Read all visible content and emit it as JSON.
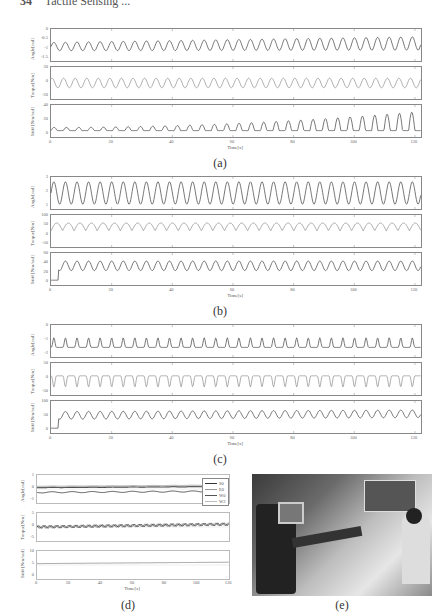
{
  "page": {
    "number": "34",
    "running_header": "Tactile Sensing ..."
  },
  "figure": {
    "captions": [
      "(a)",
      "(b)",
      "(c)",
      "(d)",
      "(e)"
    ],
    "xlabel": "Time[s]",
    "xticks": [
      "0",
      "20",
      "40",
      "60",
      "80",
      "100",
      "120"
    ]
  },
  "chart_data": [
    {
      "type": "line",
      "title": "(a)",
      "xlabel": "Time[s]",
      "xlim": [
        0,
        122
      ],
      "subplots": [
        {
          "ylabel": "Angle[rad]",
          "yticks": [
            "0",
            "-0.5",
            "-1",
            "-1.5"
          ],
          "ylim": [
            -1.5,
            0
          ],
          "description": "sinusoid ~32 cycles, mean ~-0.75, amplitude ~0.15 slowly increasing"
        },
        {
          "ylabel": "Torque[Nm]",
          "yticks": [
            "20",
            "0",
            "-20"
          ],
          "ylim": [
            -20,
            20
          ],
          "description": "oscillation around 0, amplitude ~5"
        },
        {
          "ylabel": "Stiff [Nm/rad]",
          "yticks": [
            "40",
            "20",
            "0"
          ],
          "ylim": [
            0,
            40
          ],
          "description": "oscillation baseline ~8, peaks growing to ~35 after t=90"
        }
      ]
    },
    {
      "type": "line",
      "title": "(b)",
      "xlabel": "Time[s]",
      "xlim": [
        0,
        122
      ],
      "subplots": [
        {
          "ylabel": "Angle[rad]",
          "yticks": [
            "3",
            "2",
            "1"
          ],
          "ylim": [
            1,
            3
          ],
          "description": "large sinusoid ~32 cycles between ~1.3 and ~2.7"
        },
        {
          "ylabel": "Torque[Nm]",
          "yticks": [
            "100",
            "50",
            "0",
            "-50"
          ],
          "ylim": [
            -50,
            100
          ],
          "description": "oscillation between ~0 and ~60"
        },
        {
          "ylabel": "Stiff [Nm/rad]",
          "yticks": [
            "60",
            "40",
            "20",
            "0"
          ],
          "ylim": [
            0,
            60
          ],
          "description": "rises from ~10 to oscillation between ~30 and ~55"
        }
      ]
    },
    {
      "type": "line",
      "title": "(c)",
      "xlabel": "Time[s]",
      "xlim": [
        0,
        122
      ],
      "subplots": [
        {
          "ylabel": "Angle[rad]",
          "yticks": [
            "0",
            "-1",
            "-2"
          ],
          "ylim": [
            -2,
            0
          ],
          "description": "peaky oscillation ~-1.5 to ~-0.8"
        },
        {
          "ylabel": "Torque[Nm]",
          "yticks": [
            "50",
            "0",
            "-50"
          ],
          "ylim": [
            -50,
            50
          ],
          "description": "negative dips to ~-30 from ~0"
        },
        {
          "ylabel": "Stiff [Nm/rad]",
          "yticks": [
            "100",
            "50",
            "0"
          ],
          "ylim": [
            0,
            100
          ],
          "description": "rises from ~10 to oscillation between ~50 and ~85"
        }
      ]
    },
    {
      "type": "line",
      "title": "(d)",
      "xlabel": "Time[s]",
      "xlim": [
        0,
        122
      ],
      "legend": [
        "S0",
        "E0",
        "W0",
        "W2"
      ],
      "legend_position": "upper right",
      "subplots": [
        {
          "ylabel": "Angle[rad]",
          "yticks": [
            "1",
            "0",
            "-1"
          ],
          "ylim": [
            -1,
            1
          ],
          "series": [
            {
              "name": "S0",
              "mean": 0.1
            },
            {
              "name": "E0",
              "mean": 0.2
            },
            {
              "name": "W0",
              "mean": -0.25
            },
            {
              "name": "W2",
              "mean": 0.15
            }
          ]
        },
        {
          "ylabel": "Torque[Nm]",
          "yticks": [
            "5",
            "0",
            "-5"
          ],
          "ylim": [
            -5,
            5
          ],
          "description": "all joints near 0 to 1, small oscillations"
        },
        {
          "ylabel": "Stiff [Nm/rad]",
          "yticks": [
            "10",
            "5",
            "0"
          ],
          "ylim": [
            0,
            10
          ],
          "description": "flat ~5-6 slowly increasing"
        }
      ]
    }
  ],
  "photo": {
    "caption": "(e)",
    "description": "Baxter robot with operator wearing arm sensors in lab"
  }
}
